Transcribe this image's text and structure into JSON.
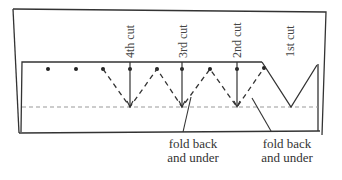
{
  "diagram": {
    "cut_labels": [
      "4th cut",
      "3rd cut",
      "2nd cut",
      "1st cut"
    ],
    "fold_labels": [
      {
        "line1": "fold back",
        "line2": "and under"
      },
      {
        "line1": "fold back",
        "line2": "and under"
      }
    ],
    "colors": {
      "stroke": "#333333",
      "dashed": "#999999"
    }
  }
}
